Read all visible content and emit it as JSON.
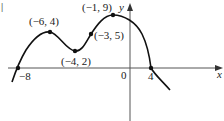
{
  "figure": {
    "corner_mark": "|",
    "x_axis_label": "x",
    "y_axis_label": "y",
    "origin_label": "0",
    "ticks": {
      "x_neg8": "−8",
      "x_4": "4"
    },
    "points": [
      {
        "label": "(−6, 4)",
        "x": -6,
        "y": 4
      },
      {
        "label": "(−4, 2)",
        "x": -4,
        "y": 2
      },
      {
        "label": "(−3, 5)",
        "x": -3,
        "y": 5
      },
      {
        "label": "(−1, 9)",
        "x": -1,
        "y": 9
      },
      {
        "label": "−8",
        "x": -8,
        "y": 0
      },
      {
        "label": "4",
        "x": 4,
        "y": 0
      }
    ],
    "colors": {
      "curve": "#111111",
      "axis": "#555555",
      "background": "#ffffff"
    }
  }
}
